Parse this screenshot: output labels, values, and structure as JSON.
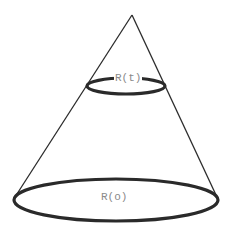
{
  "diagram": {
    "type": "cone",
    "labels": {
      "top_circle": "R(t)",
      "base_circle": "R(o)"
    },
    "colors": {
      "stroke": "#2a2a2a",
      "label": "#8a8a8a",
      "background": "#ffffff"
    }
  }
}
